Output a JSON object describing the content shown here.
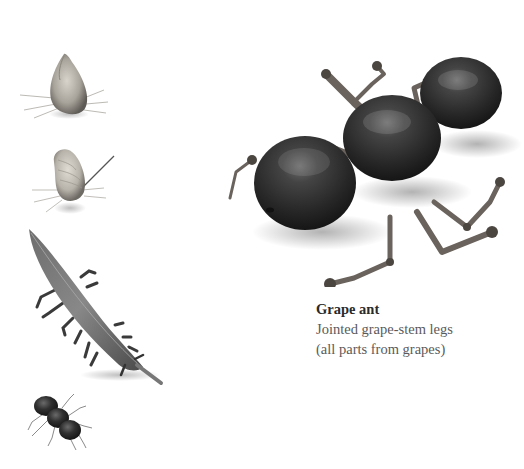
{
  "caption": {
    "title": "Grape ant",
    "line1": "Jointed grape-stem legs",
    "line2": "(all parts from grapes)"
  },
  "figures": [
    {
      "id": "seed-insect",
      "description": "seed-bodied insect with thin legs"
    },
    {
      "id": "peanut-bug",
      "description": "peanut-shell bug with antenna"
    },
    {
      "id": "pod-caterpillar",
      "description": "bean-pod caterpillar with stem legs"
    },
    {
      "id": "small-ant",
      "description": "small dark ant"
    },
    {
      "id": "grape-ant",
      "description": "ant made of three grapes with grape-stem legs"
    }
  ],
  "colors": {
    "background": "#ffffff",
    "grape": "#2c2c2c",
    "stem": "#6a625c",
    "caption_title": "#2a2a2a",
    "caption_text": "#5a5a5a"
  }
}
